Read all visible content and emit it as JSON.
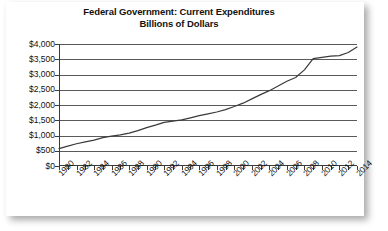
{
  "chart_data": {
    "type": "line",
    "title": "Federal Government: Current Expenditures",
    "subtitle": "Billions of Dollars",
    "xlabel": "",
    "ylabel": "",
    "ylim": [
      0,
      4000
    ],
    "ytick_step": 500,
    "xlim": [
      1980,
      2014
    ],
    "xtick_step": 1,
    "xlabel_step": 2,
    "grid": true,
    "legend": false,
    "legend_position": "none",
    "line_color": "#3a3a3a",
    "y_ticklabels": [
      "$4,000",
      "$3,500",
      "$3,000",
      "$2,500",
      "$2,000",
      "$1,500",
      "$1,000",
      "$500",
      "$0"
    ],
    "y_tickvalues": [
      4000,
      3500,
      3000,
      2500,
      2000,
      1500,
      1000,
      500,
      0
    ],
    "x_ticklabels": [
      "1980",
      "1982",
      "1984",
      "1986",
      "1988",
      "1990",
      "1992",
      "1994",
      "1996",
      "1998",
      "2000",
      "2002",
      "2004",
      "2006",
      "2008",
      "2010",
      "2012",
      "2014"
    ],
    "x_tickvalues": [
      1980,
      1982,
      1984,
      1986,
      1988,
      1990,
      1992,
      1994,
      1996,
      1998,
      2000,
      2002,
      2004,
      2006,
      2008,
      2010,
      2012,
      2014
    ],
    "x": [
      1980,
      1981,
      1982,
      1983,
      1984,
      1985,
      1986,
      1987,
      1988,
      1989,
      1990,
      1991,
      1992,
      1993,
      1994,
      1995,
      1996,
      1997,
      1998,
      1999,
      2000,
      2001,
      2002,
      2003,
      2004,
      2005,
      2006,
      2007,
      2008,
      2009,
      2010,
      2011,
      2012,
      2013,
      2014
    ],
    "values": [
      570,
      650,
      730,
      790,
      850,
      930,
      980,
      1020,
      1080,
      1160,
      1260,
      1340,
      1430,
      1470,
      1510,
      1580,
      1650,
      1710,
      1770,
      1850,
      1950,
      2060,
      2200,
      2340,
      2470,
      2620,
      2780,
      2900,
      3150,
      3520,
      3560,
      3600,
      3620,
      3720,
      3900
    ],
    "series": [
      {
        "name": "Current Expenditures",
        "values": [
          570,
          650,
          730,
          790,
          850,
          930,
          980,
          1020,
          1080,
          1160,
          1260,
          1340,
          1430,
          1470,
          1510,
          1580,
          1650,
          1710,
          1770,
          1850,
          1950,
          2060,
          2200,
          2340,
          2470,
          2620,
          2780,
          2900,
          3150,
          3520,
          3560,
          3600,
          3620,
          3720,
          3900
        ]
      }
    ]
  }
}
